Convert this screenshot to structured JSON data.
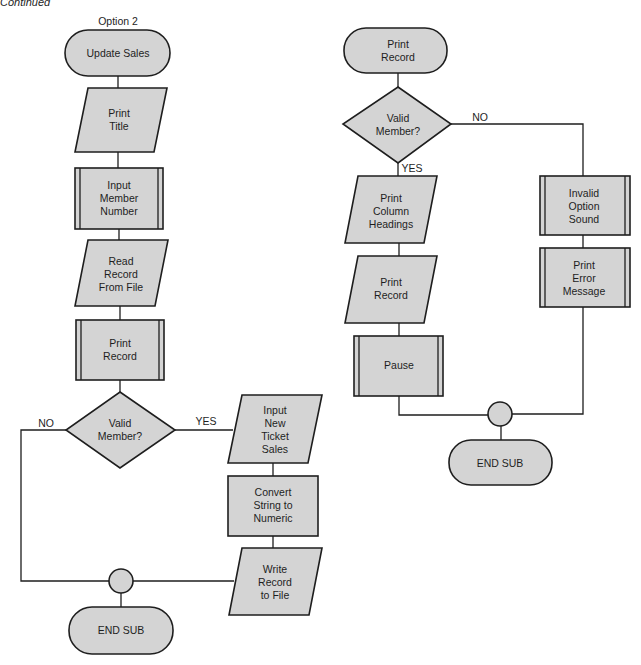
{
  "caption": "Continued",
  "left_flow": {
    "title": "Option 2",
    "start": "Update Sales",
    "steps": [
      {
        "shape": "parallelogram",
        "lines": [
          "Print",
          "Title"
        ]
      },
      {
        "shape": "predefined-process",
        "lines": [
          "Input",
          "Member",
          "Number"
        ]
      },
      {
        "shape": "parallelogram",
        "lines": [
          "Read",
          "Record",
          "From File"
        ]
      },
      {
        "shape": "predefined-process",
        "lines": [
          "Print",
          "Record"
        ]
      }
    ],
    "decision": {
      "lines": [
        "Valid",
        "Member?"
      ],
      "yes_label": "YES",
      "no_label": "NO"
    },
    "yes_branch": [
      {
        "shape": "parallelogram",
        "lines": [
          "Input",
          "New",
          "Ticket",
          "Sales"
        ]
      },
      {
        "shape": "process",
        "lines": [
          "Convert",
          "String to",
          "Numeric"
        ]
      },
      {
        "shape": "parallelogram",
        "lines": [
          "Write",
          "Record",
          "to File"
        ]
      }
    ],
    "end": "END SUB"
  },
  "right_flow": {
    "start": [
      "Print",
      "Record"
    ],
    "decision": {
      "lines": [
        "Valid",
        "Member?"
      ],
      "yes_label": "YES",
      "no_label": "NO"
    },
    "yes_branch": [
      {
        "shape": "parallelogram",
        "lines": [
          "Print",
          "Column",
          "Headings"
        ]
      },
      {
        "shape": "parallelogram",
        "lines": [
          "Print",
          "Record"
        ]
      },
      {
        "shape": "predefined-process",
        "lines": [
          "Pause"
        ]
      }
    ],
    "no_branch": [
      {
        "shape": "predefined-process",
        "lines": [
          "Invalid",
          "Option",
          "Sound"
        ]
      },
      {
        "shape": "predefined-process",
        "lines": [
          "Print",
          "Error",
          "Message"
        ]
      }
    ],
    "end": "END SUB"
  },
  "colors": {
    "shape_fill": "#d4d4d4",
    "stroke": "#1e1e1e",
    "background": "#ffffff"
  }
}
